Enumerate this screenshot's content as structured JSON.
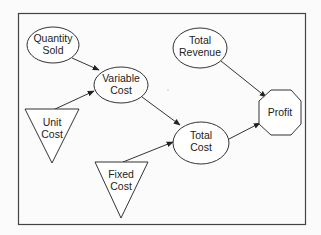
{
  "diagram": {
    "type": "influence-diagram",
    "nodes": [
      {
        "id": "quantity_sold",
        "shape": "ellipse",
        "lines": [
          "Quantity",
          "Sold"
        ]
      },
      {
        "id": "variable_cost",
        "shape": "ellipse",
        "lines": [
          "Variable",
          "Cost"
        ]
      },
      {
        "id": "unit_cost",
        "shape": "triangle",
        "lines": [
          "Unit",
          "Cost"
        ]
      },
      {
        "id": "total_revenue",
        "shape": "ellipse",
        "lines": [
          "Total",
          "Revenue"
        ]
      },
      {
        "id": "total_cost",
        "shape": "ellipse",
        "lines": [
          "Total",
          "Cost"
        ]
      },
      {
        "id": "fixed_cost",
        "shape": "triangle",
        "lines": [
          "Fixed",
          "Cost"
        ]
      },
      {
        "id": "profit",
        "shape": "octagon",
        "lines": [
          "Profit"
        ]
      }
    ],
    "edges": [
      {
        "from": "quantity_sold",
        "to": "variable_cost"
      },
      {
        "from": "unit_cost",
        "to": "variable_cost"
      },
      {
        "from": "variable_cost",
        "to": "total_cost"
      },
      {
        "from": "fixed_cost",
        "to": "total_cost"
      },
      {
        "from": "total_cost",
        "to": "profit"
      },
      {
        "from": "total_revenue",
        "to": "profit"
      }
    ]
  }
}
